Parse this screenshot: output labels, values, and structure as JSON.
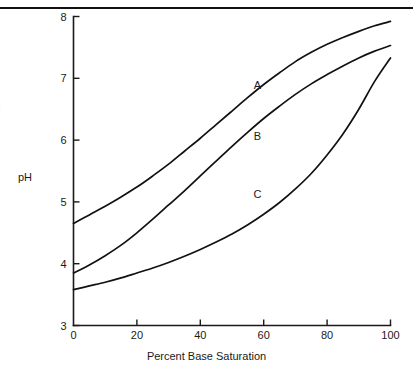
{
  "figure": {
    "clipped_left_text": "d",
    "top_rule": true
  },
  "chart_data": {
    "type": "line",
    "title": "",
    "xlabel": "Percent Base Saturation",
    "ylabel": "pH",
    "xlim": [
      0,
      100
    ],
    "ylim": [
      3,
      8
    ],
    "xticks": [
      0,
      20,
      40,
      60,
      80,
      100
    ],
    "xtick_labels": [
      "0",
      "20",
      "40",
      "60",
      "80",
      "100"
    ],
    "yticks": [
      3,
      4,
      5,
      6,
      7,
      8
    ],
    "ytick_labels": [
      "3",
      "4",
      "5",
      "6",
      "7",
      "8"
    ],
    "grid": false,
    "legend": "inline-curve-labels",
    "series": [
      {
        "name": "A",
        "label": "A",
        "label_x": 58,
        "label_y": 6.83,
        "x": [
          0,
          5,
          10,
          15,
          20,
          25,
          30,
          35,
          40,
          45,
          50,
          55,
          60,
          65,
          70,
          75,
          80,
          85,
          90,
          95,
          100
        ],
        "values": [
          4.65,
          4.79,
          4.93,
          5.08,
          5.24,
          5.42,
          5.61,
          5.82,
          6.03,
          6.25,
          6.47,
          6.69,
          6.9,
          7.09,
          7.27,
          7.42,
          7.55,
          7.66,
          7.76,
          7.85,
          7.92
        ]
      },
      {
        "name": "B",
        "label": "B",
        "label_x": 58,
        "label_y": 6.0,
        "x": [
          0,
          5,
          10,
          15,
          20,
          25,
          30,
          35,
          40,
          45,
          50,
          55,
          60,
          65,
          70,
          75,
          80,
          85,
          90,
          95,
          100
        ],
        "values": [
          3.85,
          3.98,
          4.13,
          4.3,
          4.5,
          4.72,
          4.95,
          5.18,
          5.42,
          5.66,
          5.9,
          6.13,
          6.35,
          6.55,
          6.74,
          6.91,
          7.06,
          7.2,
          7.33,
          7.44,
          7.53
        ]
      },
      {
        "name": "C",
        "label": "C",
        "label_x": 58,
        "label_y": 5.07,
        "x": [
          0,
          5,
          10,
          15,
          20,
          25,
          30,
          35,
          40,
          45,
          50,
          55,
          60,
          65,
          70,
          75,
          80,
          85,
          90,
          95,
          100
        ],
        "values": [
          3.58,
          3.64,
          3.7,
          3.77,
          3.85,
          3.93,
          4.02,
          4.12,
          4.23,
          4.35,
          4.48,
          4.63,
          4.8,
          4.99,
          5.21,
          5.46,
          5.76,
          6.1,
          6.5,
          6.95,
          7.33
        ]
      }
    ]
  }
}
